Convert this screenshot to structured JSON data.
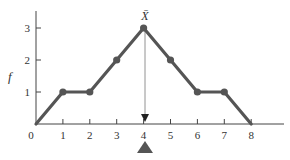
{
  "chart_data": {
    "type": "line",
    "title": "",
    "xlabel": "",
    "ylabel": "f",
    "x": [
      0,
      1,
      2,
      3,
      4,
      5,
      6,
      7,
      8
    ],
    "series": [
      {
        "name": "frequency",
        "values": [
          0,
          1,
          1,
          2,
          3,
          2,
          1,
          1,
          0
        ]
      }
    ],
    "marked_points": [
      1,
      2,
      3,
      4,
      5,
      6,
      7
    ],
    "x_ticks": [
      "0",
      "1",
      "2",
      "3",
      "4",
      "5",
      "6",
      "7",
      "8"
    ],
    "y_ticks": [
      "1",
      "2",
      "3"
    ],
    "xlim": [
      0,
      9
    ],
    "ylim": [
      0,
      3.5
    ],
    "grid": false,
    "legend": null,
    "annotations": [
      {
        "type": "mean-marker",
        "label": "X̄",
        "x": 4,
        "description": "vertical arrow from peak to axis at mean"
      },
      {
        "type": "balance-point",
        "x": 4,
        "description": "filled triangle fulcrum below x-axis"
      }
    ],
    "colors": {
      "line": "#555555",
      "axis": "#444444",
      "marker": "#555555",
      "fulcrum": "#555555"
    }
  },
  "labels": {
    "y_axis": "f",
    "mean": "X̄",
    "x_ticks": [
      "0",
      "1",
      "2",
      "3",
      "4",
      "5",
      "6",
      "7",
      "8"
    ],
    "y_ticks": [
      "1",
      "2",
      "3"
    ]
  }
}
